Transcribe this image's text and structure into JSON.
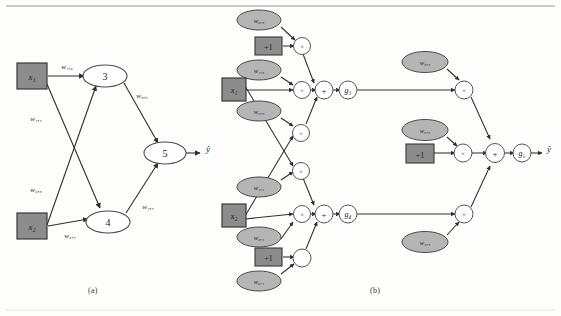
{
  "figure": {
    "captions": {
      "a": "(a)",
      "b": "(b)"
    },
    "colors": {
      "input_box_fill": "#8c8c8c",
      "input_box_stroke": "#3a3a3a",
      "weight_ellipse_fill": "#b5b5b5",
      "weight_ellipse_stroke": "#4a4a4a",
      "op_node_fill": "#ffffff",
      "op_node_stroke": "#555555",
      "edge": "#3a3a3a",
      "paper": "#fdfdfc",
      "rule": "#9a9a9a"
    }
  },
  "diagram_a": {
    "label": "(a)",
    "inputs": [
      {
        "name": "input-x1",
        "label": "x₁"
      },
      {
        "name": "input-x2",
        "label": "x₂"
      }
    ],
    "neurons": [
      {
        "name": "neuron-3",
        "label": "3"
      },
      {
        "name": "neuron-4",
        "label": "4"
      },
      {
        "name": "neuron-5",
        "label": "5"
      }
    ],
    "output": {
      "name": "output-yhat",
      "label": "ŷ"
    },
    "edge_labels": [
      {
        "name": "weight-w13",
        "label": "w₁,₃"
      },
      {
        "name": "weight-w14",
        "label": "w₁,₄"
      },
      {
        "name": "weight-w23",
        "label": "w₂,₃"
      },
      {
        "name": "weight-w24",
        "label": "w₂,₄"
      },
      {
        "name": "weight-w35",
        "label": "w₃,₅"
      },
      {
        "name": "weight-w45",
        "label": "w₄,₅"
      }
    ]
  },
  "diagram_b": {
    "label": "(b)",
    "inputs": [
      {
        "name": "input-x1",
        "label": "x₁"
      },
      {
        "name": "input-x2",
        "label": "x₂"
      }
    ],
    "bias_boxes": [
      {
        "name": "bias-top",
        "label": "+1"
      },
      {
        "name": "bias-bottom",
        "label": "+1"
      },
      {
        "name": "bias-output",
        "label": "+1"
      }
    ],
    "weights": [
      {
        "name": "weight-w03",
        "label": "w₀,₃"
      },
      {
        "name": "weight-w13",
        "label": "w₁,₃"
      },
      {
        "name": "weight-w23",
        "label": "w₂,₃"
      },
      {
        "name": "weight-w14",
        "label": "w₁,₄"
      },
      {
        "name": "weight-w24",
        "label": "w₂,₄"
      },
      {
        "name": "weight-w04",
        "label": "w₀,₄"
      },
      {
        "name": "weight-w35",
        "label": "w₃,₅"
      },
      {
        "name": "weight-w05",
        "label": "w₀,₅"
      },
      {
        "name": "weight-w45",
        "label": "w₄,₅"
      }
    ],
    "operators": {
      "multiply": "×",
      "add": "+"
    },
    "activations": [
      {
        "name": "activation-g3",
        "label": "g₃"
      },
      {
        "name": "activation-g4",
        "label": "g₄"
      },
      {
        "name": "activation-g5",
        "label": "g₅"
      }
    ],
    "output": {
      "name": "output-yhat",
      "label": "ŷ"
    }
  }
}
